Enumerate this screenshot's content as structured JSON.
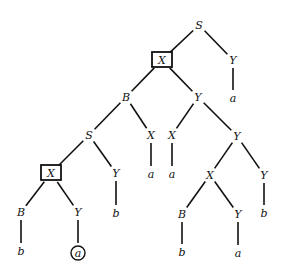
{
  "diagram": {
    "type": "parse-tree",
    "nodes": [
      {
        "id": "n1",
        "label": "S",
        "x": 199,
        "y": 25,
        "mark": "none"
      },
      {
        "id": "n2",
        "label": "X",
        "x": 162,
        "y": 60,
        "mark": "box"
      },
      {
        "id": "n3",
        "label": "Y",
        "x": 233,
        "y": 60,
        "mark": "none"
      },
      {
        "id": "n4",
        "label": "a",
        "x": 233,
        "y": 98,
        "mark": "none"
      },
      {
        "id": "n5",
        "label": "B",
        "x": 126,
        "y": 97,
        "mark": "none"
      },
      {
        "id": "n6",
        "label": "Y",
        "x": 198,
        "y": 97,
        "mark": "none"
      },
      {
        "id": "n7",
        "label": "S",
        "x": 89,
        "y": 135,
        "mark": "none"
      },
      {
        "id": "n8",
        "label": "X",
        "x": 151,
        "y": 135,
        "mark": "none"
      },
      {
        "id": "n9",
        "label": "X",
        "x": 172,
        "y": 135,
        "mark": "none"
      },
      {
        "id": "n10",
        "label": "Y",
        "x": 237,
        "y": 136,
        "mark": "none"
      },
      {
        "id": "n11",
        "label": "a",
        "x": 151,
        "y": 174,
        "mark": "none"
      },
      {
        "id": "n12",
        "label": "a",
        "x": 172,
        "y": 174,
        "mark": "none"
      },
      {
        "id": "n13",
        "label": "X",
        "x": 51,
        "y": 173,
        "mark": "box"
      },
      {
        "id": "n14",
        "label": "Y",
        "x": 116,
        "y": 173,
        "mark": "none"
      },
      {
        "id": "n15",
        "label": "X",
        "x": 210,
        "y": 175,
        "mark": "none"
      },
      {
        "id": "n16",
        "label": "Y",
        "x": 264,
        "y": 175,
        "mark": "none"
      },
      {
        "id": "n17",
        "label": "B",
        "x": 21,
        "y": 212,
        "mark": "none"
      },
      {
        "id": "n18",
        "label": "Y",
        "x": 78,
        "y": 212,
        "mark": "none"
      },
      {
        "id": "n19",
        "label": "b",
        "x": 116,
        "y": 213,
        "mark": "none"
      },
      {
        "id": "n20",
        "label": "B",
        "x": 182,
        "y": 214,
        "mark": "none"
      },
      {
        "id": "n21",
        "label": "Y",
        "x": 238,
        "y": 214,
        "mark": "none"
      },
      {
        "id": "n22",
        "label": "b",
        "x": 264,
        "y": 213,
        "mark": "none"
      },
      {
        "id": "n23",
        "label": "b",
        "x": 21,
        "y": 251,
        "mark": "none"
      },
      {
        "id": "n24",
        "label": "a",
        "x": 78,
        "y": 253,
        "mark": "circle"
      },
      {
        "id": "n25",
        "label": "b",
        "x": 182,
        "y": 252,
        "mark": "none"
      },
      {
        "id": "n26",
        "label": "a",
        "x": 238,
        "y": 253,
        "mark": "none"
      }
    ],
    "edges": [
      [
        "n1",
        "n2"
      ],
      [
        "n1",
        "n3"
      ],
      [
        "n3",
        "n4"
      ],
      [
        "n2",
        "n5"
      ],
      [
        "n2",
        "n6"
      ],
      [
        "n5",
        "n7"
      ],
      [
        "n5",
        "n8"
      ],
      [
        "n8",
        "n11"
      ],
      [
        "n6",
        "n9"
      ],
      [
        "n6",
        "n10"
      ],
      [
        "n9",
        "n12"
      ],
      [
        "n7",
        "n13"
      ],
      [
        "n7",
        "n14"
      ],
      [
        "n14",
        "n19"
      ],
      [
        "n10",
        "n15"
      ],
      [
        "n10",
        "n16"
      ],
      [
        "n16",
        "n22"
      ],
      [
        "n13",
        "n17"
      ],
      [
        "n13",
        "n18"
      ],
      [
        "n17",
        "n23"
      ],
      [
        "n18",
        "n24"
      ],
      [
        "n15",
        "n20"
      ],
      [
        "n15",
        "n21"
      ],
      [
        "n20",
        "n25"
      ],
      [
        "n21",
        "n26"
      ]
    ]
  }
}
